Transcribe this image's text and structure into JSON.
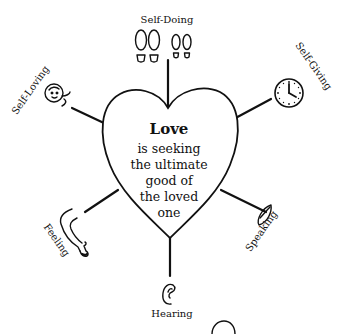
{
  "center": {
    "title": "Love",
    "lines": [
      "is seeking",
      "the ultimate",
      "good of",
      "the loved",
      "one"
    ]
  },
  "spokes": [
    {
      "label": "Self-Doing",
      "icon": "footprints-icon"
    },
    {
      "label": "Self-Giving",
      "icon": "clock-icon"
    },
    {
      "label": "Speaking",
      "icon": "lips-icon"
    },
    {
      "label": "Hearing",
      "icon": "ear-icon"
    },
    {
      "label": "Feeling",
      "icon": "arm-hand-icon"
    },
    {
      "label": "Self-Loving",
      "icon": "face-icon"
    }
  ],
  "colors": {
    "ink": "#111111",
    "background": "#ffffff"
  }
}
